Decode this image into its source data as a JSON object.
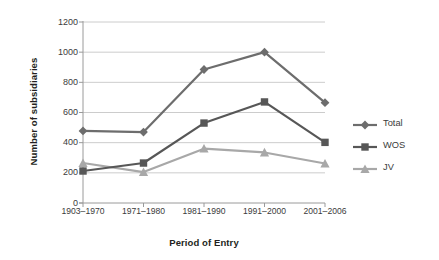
{
  "chart_data": {
    "type": "line",
    "title": "",
    "xlabel": "Period of Entry",
    "ylabel": "Number of subsidiaries",
    "categories": [
      "1903–1970",
      "1971–1980",
      "1981–1990",
      "1991–2000",
      "2001–2006"
    ],
    "series": [
      {
        "name": "Total",
        "marker": "diamond",
        "color": "#6d6d6d",
        "values": [
          478,
          470,
          885,
          1000,
          665
        ]
      },
      {
        "name": "WOS",
        "marker": "square",
        "color": "#575757",
        "values": [
          212,
          265,
          530,
          670,
          402
        ]
      },
      {
        "name": "JV",
        "marker": "triangle",
        "color": "#a8a8a8",
        "values": [
          265,
          205,
          360,
          335,
          262
        ]
      }
    ],
    "ylim": [
      0,
      1200
    ],
    "yticks": [
      0,
      200,
      400,
      600,
      800,
      1000,
      1200
    ],
    "ytick_labels": [
      "0",
      "200",
      "400",
      "600",
      "800",
      "1000",
      "1200"
    ],
    "grid": true,
    "grid_axis": "y",
    "grid_color": "#bfbfbf",
    "axis_color": "#9a9a9a",
    "legend_position": "right",
    "background": "#ffffff"
  },
  "legend": {
    "entries": [
      {
        "label": "Total"
      },
      {
        "label": "WOS"
      },
      {
        "label": "JV"
      }
    ]
  }
}
